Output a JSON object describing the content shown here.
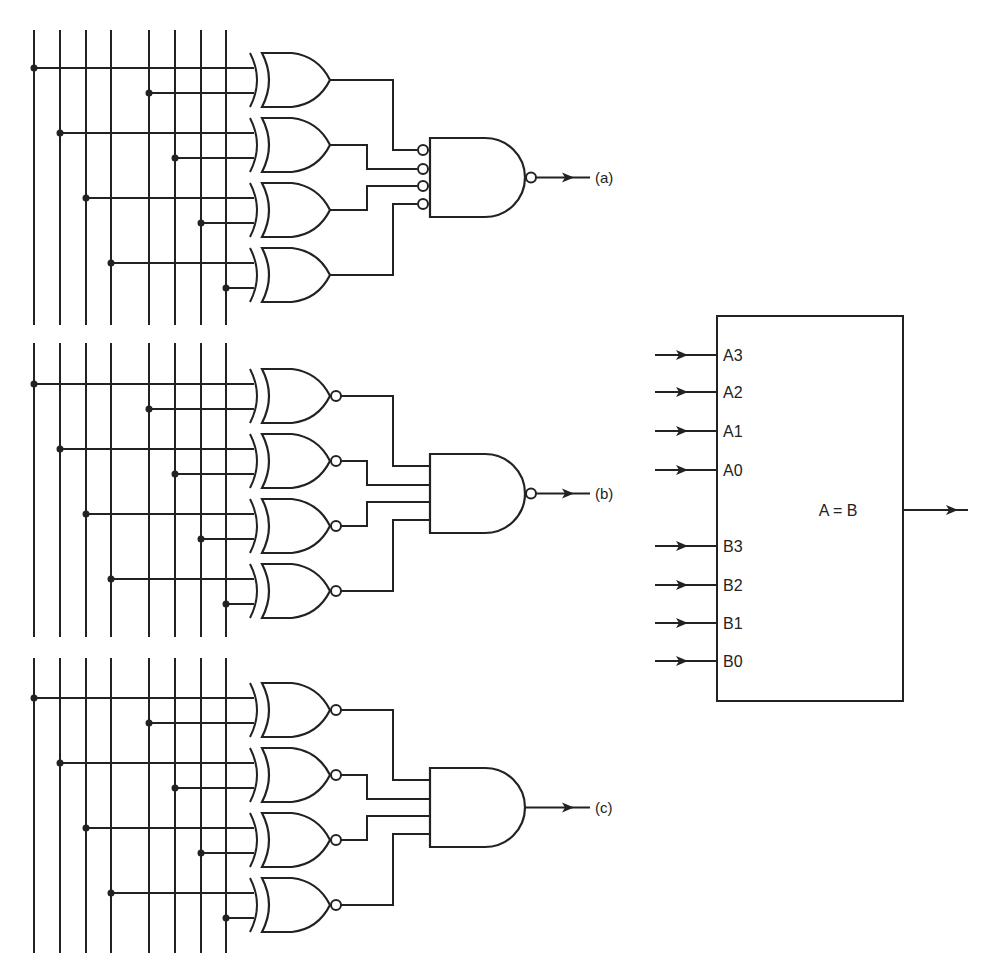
{
  "figure": {
    "type": "4-bit equality comparator logic implementations",
    "bus_lines": 8,
    "sections": [
      {
        "id": "a",
        "label": "(a)",
        "gate_type": "XOR",
        "combiner": "NAND",
        "combiner_inputs_inverted": true,
        "output_inverted": true
      },
      {
        "id": "b",
        "label": "(b)",
        "gate_type": "XNOR",
        "combiner": "NAND",
        "combiner_inputs_inverted": false,
        "output_inverted": true
      },
      {
        "id": "c",
        "label": "(c)",
        "gate_type": "XNOR",
        "combiner": "AND",
        "combiner_inputs_inverted": false,
        "output_inverted": false
      }
    ]
  },
  "block": {
    "inputs_a": [
      "A3",
      "A2",
      "A1",
      "A0"
    ],
    "inputs_b": [
      "B3",
      "B2",
      "B1",
      "B0"
    ],
    "output_label": "A = B"
  },
  "colors": {
    "ink": "#222222",
    "background": "#ffffff"
  }
}
